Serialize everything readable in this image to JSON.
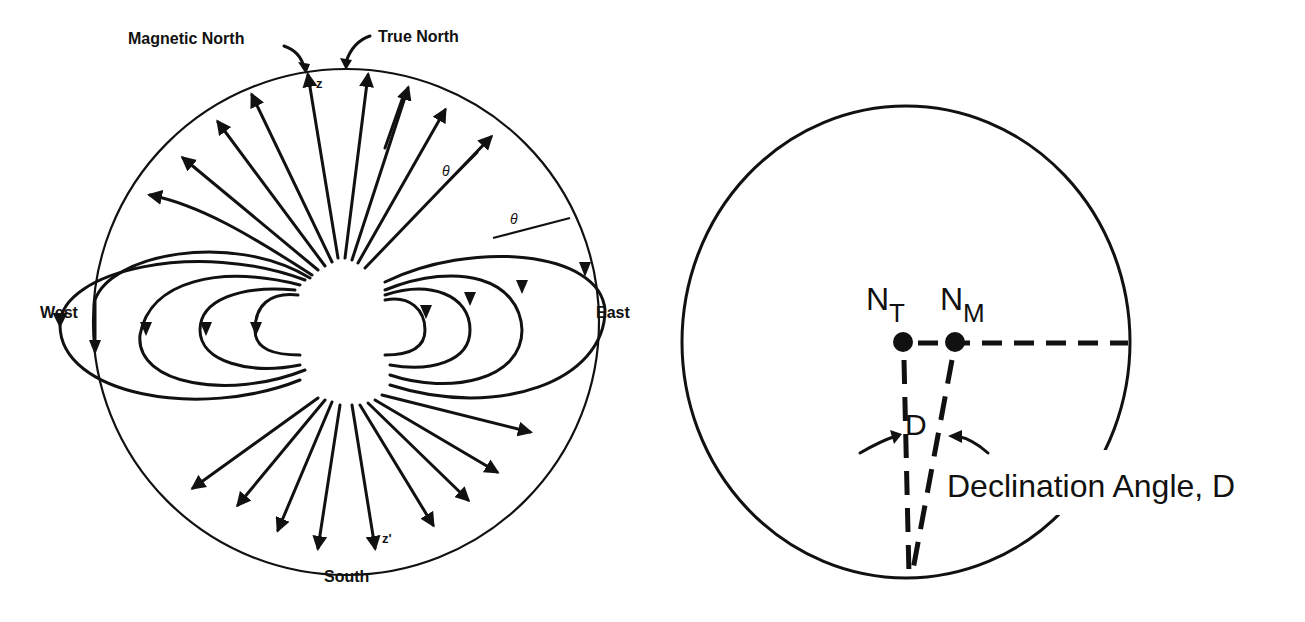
{
  "left_figure": {
    "title": "Earth magnetic dipole field lines",
    "labels": {
      "magnetic_north": "Magnetic North",
      "true_north": "True North",
      "west": "West",
      "east": "East",
      "south": "South",
      "z": "z",
      "z_prime": "z'",
      "theta_1": "θ",
      "theta_2": "θ"
    }
  },
  "right_figure": {
    "title": "Declination diagram",
    "labels": {
      "n_true": "N",
      "n_true_sub": "T",
      "n_mag": "N",
      "n_mag_sub": "M",
      "d": "D",
      "declination": "Declination Angle, D"
    }
  },
  "colors": {
    "ink": "#111111",
    "background": "#ffffff"
  }
}
